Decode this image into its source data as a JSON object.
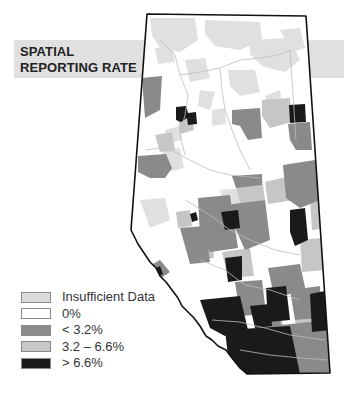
{
  "title": {
    "line1": "SPATIAL",
    "line2": "REPORTING RATE"
  },
  "legend": {
    "items": [
      {
        "label": "Insufficient Data",
        "color": "#dcdcdc"
      },
      {
        "label": "0%",
        "color": "#ffffff"
      },
      {
        "label": "< 3.2%",
        "color": "#8c8c8c"
      },
      {
        "label": "3.2 – 6.6%",
        "color": "#c8c8c8"
      },
      {
        "label": "> 6.6%",
        "color": "#1a1a1a"
      }
    ]
  },
  "map": {
    "region": "Alberta",
    "outline_color": "#111111",
    "river_color": "#bdbdbd"
  }
}
